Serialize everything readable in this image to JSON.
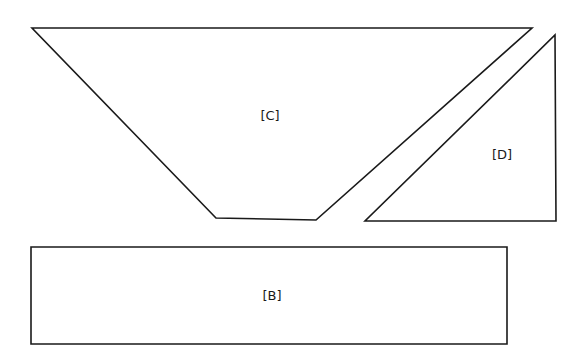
{
  "diagram": {
    "type": "geometric-shapes",
    "canvas": {
      "width": 584,
      "height": 363,
      "background": "#ffffff"
    },
    "stroke_color": "#1a1a1a",
    "shapes": [
      {
        "id": "C",
        "label": "[C]",
        "kind": "trapezoid",
        "points": "32,28 532,28 316,220 216,218",
        "label_pos": {
          "x": 270,
          "y": 116
        }
      },
      {
        "id": "D",
        "label": "[D]",
        "kind": "right-triangle",
        "points": "555,35 556,221 365,221",
        "label_pos": {
          "x": 502,
          "y": 155
        }
      },
      {
        "id": "B",
        "label": "[B]",
        "kind": "rectangle",
        "points": "31,247 507,247 507,344 31,344",
        "label_pos": {
          "x": 272,
          "y": 296
        }
      }
    ]
  }
}
